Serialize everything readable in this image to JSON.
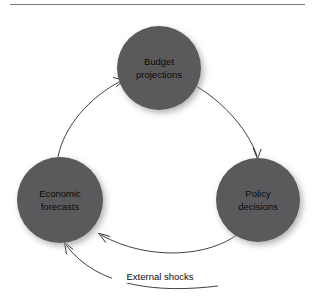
{
  "diagram": {
    "background_color": "#ffffff",
    "node_fill_color": "#5a5a5c",
    "node_text_color": "#0a0a0a",
    "edge_color": "#2b2b2b",
    "rule_color": "#77777a",
    "nodes": [
      {
        "id": "budget-projections",
        "line1": "Budget",
        "line2": "projections",
        "cx": 159,
        "cy": 68,
        "r": 42
      },
      {
        "id": "policy-decisions",
        "line1": "Policy",
        "line2": "decisions",
        "cx": 258,
        "cy": 200,
        "r": 42
      },
      {
        "id": "economic-forecasts",
        "line1": "Economic",
        "line2": "forecasts",
        "cx": 60,
        "cy": 200,
        "r": 43
      }
    ],
    "edges": [
      {
        "id": "budget-to-policy",
        "from": "budget-projections",
        "to": "policy-decisions",
        "label": ""
      },
      {
        "id": "policy-to-economic",
        "from": "policy-decisions",
        "to": "economic-forecasts",
        "label": ""
      },
      {
        "id": "economic-to-budget",
        "from": "economic-forecasts",
        "to": "budget-projections",
        "label": ""
      },
      {
        "id": "external-shocks-to-economic",
        "from": "external",
        "to": "economic-forecasts",
        "label": "External shocks"
      }
    ]
  }
}
